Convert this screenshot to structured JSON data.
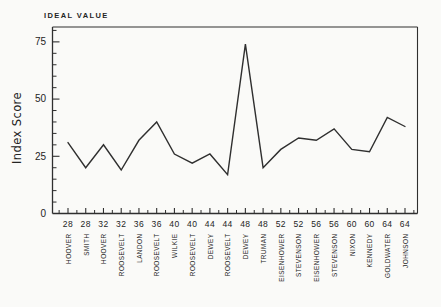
{
  "figure": {
    "background": "#fafaf8",
    "ink_color": "#2f2f2f"
  },
  "chart_data": {
    "type": "line",
    "title": "IDEAL VALUE",
    "ylabel": "Index Score",
    "xlabel": "",
    "x_year_labels": [
      "28",
      "28",
      "32",
      "32",
      "36",
      "36",
      "40",
      "40",
      "44",
      "44",
      "48",
      "48",
      "52",
      "52",
      "56",
      "56",
      "60",
      "60",
      "64",
      "64"
    ],
    "categories": [
      "HOOVER",
      "SMITH",
      "HOOVER",
      "ROOSEVELT",
      "LANDON",
      "ROOSEVELT",
      "WILKIE",
      "ROOSEVELT",
      "DEWEY",
      "ROOSEVELT",
      "DEWEY",
      "TRUMAN",
      "EISENHOWER",
      "STEVENSON",
      "EISENHOWER",
      "STEVENSON",
      "NIXON",
      "KENNEDY",
      "GOLDWATER",
      "JOHNSON"
    ],
    "values": [
      31,
      20,
      30,
      19,
      32,
      40,
      26,
      22,
      26,
      17,
      74,
      20,
      28,
      33,
      32,
      37,
      28,
      27,
      42,
      38
    ],
    "y_ticks": [
      0,
      25,
      50,
      75
    ],
    "y_minor_tick_step": 5,
    "x_minor_ticks_between_points": true,
    "ylim": [
      0,
      81.5
    ],
    "grid": false,
    "legend": "none",
    "line_color": "#2f2f2f",
    "ideal_value_line": "top border line of plot frame, labeled IDEAL VALUE"
  }
}
